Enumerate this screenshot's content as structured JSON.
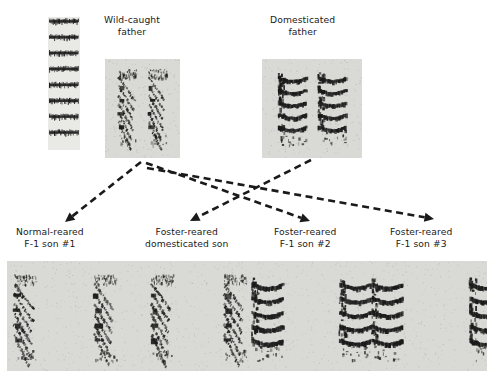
{
  "figure": {
    "type": "diagram",
    "background_color": "#ffffff",
    "panel_background_color": "#d9d9d5",
    "ink_color": "#1a1a1a"
  },
  "scale_bar": {
    "name": "frequency-scale-bar",
    "bands": 8,
    "x": 48,
    "y": 17,
    "width": 32,
    "height": 133
  },
  "fathers": [
    {
      "id": "wild-caught-father",
      "label_line1": "Wild-caught",
      "label_line2": "father",
      "label_x": 104,
      "label_y": 14,
      "panel_x": 105,
      "panel_y": 59,
      "panel_w": 75,
      "panel_h": 99,
      "song_type": "steep-descending-harmonic-stack",
      "motifs": 2
    },
    {
      "id": "domesticated-father",
      "label_line1": "Domesticated",
      "label_line2": "father",
      "label_x": 270,
      "label_y": 14,
      "panel_x": 262,
      "panel_y": 59,
      "panel_w": 100,
      "panel_h": 99,
      "song_type": "broad-arched-harmonic-bands",
      "motifs": 2
    }
  ],
  "sons": [
    {
      "id": "normal-reared-f1-son-1",
      "label_line1": "Normal-reared",
      "label_line2": "F-1 son #1",
      "label_x": 16,
      "label_y": 226,
      "sire": "wild-caught-father",
      "song_type": "steep-descending-harmonic-stack"
    },
    {
      "id": "foster-reared-domesticated-son",
      "label_line1": "Foster-reared",
      "label_line2": "domesticated son",
      "label_x": 145,
      "label_y": 226,
      "sire": "domesticated-father",
      "song_type": "steep-descending-harmonic-stack"
    },
    {
      "id": "foster-reared-f1-son-2",
      "label_line1": "Foster-reared",
      "label_line2": "F-1 son #2",
      "label_x": 274,
      "label_y": 226,
      "sire": "wild-caught-father",
      "song_type": "broad-arched-harmonic-bands"
    },
    {
      "id": "foster-reared-f1-son-3",
      "label_line1": "Foster-reared",
      "label_line2": "F-1 son #3",
      "label_x": 390,
      "label_y": 226,
      "sire": "wild-caught-father",
      "song_type": "broad-arched-harmonic-bands"
    }
  ],
  "sons_panel": {
    "name": "sons-spectrogram-strip",
    "x": 7,
    "y": 261,
    "width": 480,
    "height": 110,
    "groups": [
      {
        "son": "normal-reared-f1-son-1",
        "motifs": 2,
        "x0": 18,
        "x1": 98
      },
      {
        "son": "foster-reared-domesticated-son",
        "motifs": 2,
        "x0": 155,
        "x1": 228
      },
      {
        "son": "foster-reared-f1-son-2",
        "motifs": 2,
        "x0": 260,
        "x1": 348
      },
      {
        "son": "foster-reared-f1-son-3",
        "motifs": 2,
        "x0": 380,
        "x1": 478
      }
    ]
  },
  "arrows": [
    {
      "id": "arrow-wild-to-normal-reared-son1",
      "from": "wild-caught-father",
      "to": "normal-reared-f1-son-1",
      "x1": 141,
      "y1": 162,
      "x2": 65,
      "y2": 222,
      "style": "dashed"
    },
    {
      "id": "arrow-wild-to-f1-son2",
      "from": "wild-caught-father",
      "to": "foster-reared-f1-son-2",
      "x1": 146,
      "y1": 163,
      "x2": 310,
      "y2": 221,
      "style": "dashed"
    },
    {
      "id": "arrow-wild-to-f1-son3",
      "from": "wild-caught-father",
      "to": "foster-reared-f1-son-3",
      "x1": 147,
      "y1": 168,
      "x2": 434,
      "y2": 219,
      "style": "dashed"
    },
    {
      "id": "arrow-domesticated-to-foster-domesticated-son",
      "from": "domesticated-father",
      "to": "foster-reared-domesticated-son",
      "x1": 311,
      "y1": 160,
      "x2": 190,
      "y2": 221,
      "style": "dashed"
    }
  ]
}
